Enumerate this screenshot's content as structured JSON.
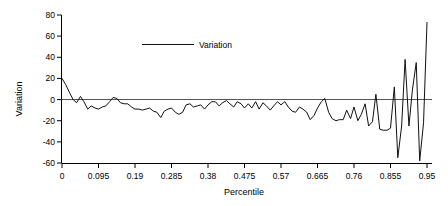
{
  "chart_data": {
    "type": "line",
    "title": "",
    "xlabel": "Percentile",
    "ylabel": "Variation",
    "xlim": [
      0,
      0.95
    ],
    "ylim": [
      -60,
      80
    ],
    "grid": false,
    "legend_position": "top-center",
    "zero_reference_line": true,
    "xticks": [
      "0",
      "0.095",
      "0.19",
      "0.285",
      "0.38",
      "0.475",
      "0.57",
      "0.665",
      "0.76",
      "0.855",
      "0.95"
    ],
    "xtick_values": [
      0,
      0.095,
      0.19,
      0.285,
      0.38,
      0.475,
      0.57,
      0.665,
      0.76,
      0.855,
      0.95
    ],
    "yticks": [
      "80",
      "60",
      "40",
      "20",
      "0",
      "-20",
      "-40",
      "-60"
    ],
    "ytick_values": [
      80,
      60,
      40,
      20,
      0,
      -20,
      -40,
      -60
    ],
    "series": [
      {
        "name": "Variation",
        "color": "#111111",
        "x": [
          0.0,
          0.01,
          0.019,
          0.029,
          0.038,
          0.048,
          0.057,
          0.067,
          0.076,
          0.086,
          0.095,
          0.105,
          0.114,
          0.124,
          0.133,
          0.143,
          0.152,
          0.162,
          0.171,
          0.181,
          0.19,
          0.2,
          0.209,
          0.219,
          0.228,
          0.238,
          0.247,
          0.257,
          0.266,
          0.276,
          0.285,
          0.295,
          0.304,
          0.314,
          0.323,
          0.333,
          0.342,
          0.352,
          0.361,
          0.371,
          0.38,
          0.39,
          0.399,
          0.409,
          0.418,
          0.428,
          0.437,
          0.447,
          0.456,
          0.466,
          0.475,
          0.485,
          0.494,
          0.504,
          0.513,
          0.523,
          0.532,
          0.542,
          0.551,
          0.561,
          0.57,
          0.58,
          0.589,
          0.599,
          0.608,
          0.618,
          0.627,
          0.637,
          0.646,
          0.656,
          0.665,
          0.675,
          0.684,
          0.694,
          0.703,
          0.713,
          0.722,
          0.732,
          0.741,
          0.751,
          0.76,
          0.77,
          0.779,
          0.789,
          0.798,
          0.808,
          0.817,
          0.827,
          0.836,
          0.846,
          0.855,
          0.865,
          0.874,
          0.884,
          0.893,
          0.903,
          0.912,
          0.922,
          0.931,
          0.941,
          0.95
        ],
        "values": [
          20,
          14,
          7,
          0,
          -3,
          3,
          -2,
          -9,
          -6,
          -8,
          -9,
          -7,
          -6,
          -2,
          2,
          1,
          -3,
          -4,
          -4,
          -7,
          -9,
          -9,
          -10,
          -9,
          -8,
          -11,
          -12,
          -17,
          -11,
          -9,
          -8,
          -12,
          -14,
          -12,
          -5,
          -4,
          -7,
          -6,
          -5,
          -9,
          -5,
          -2,
          -2,
          -6,
          -3,
          -1,
          -4,
          -7,
          -2,
          -4,
          -8,
          -4,
          -8,
          -2,
          -9,
          -3,
          -6,
          -10,
          -6,
          -2,
          -5,
          -2,
          -7,
          -11,
          -12,
          -7,
          -9,
          -12,
          -19,
          -15,
          -8,
          -2,
          1,
          -12,
          -18,
          -20,
          -19,
          -19,
          -10,
          -18,
          -7,
          -20,
          -14,
          -4,
          -25,
          -21,
          5,
          -28,
          -29,
          -29,
          -27,
          12,
          -55,
          -25,
          38,
          -25,
          9,
          35,
          -58,
          -22,
          73
        ]
      }
    ],
    "annotations": []
  },
  "legend": {
    "entries": [
      {
        "label": "Variation"
      }
    ]
  },
  "axes": {
    "x_title": "Percentile",
    "y_title": "Variation"
  }
}
